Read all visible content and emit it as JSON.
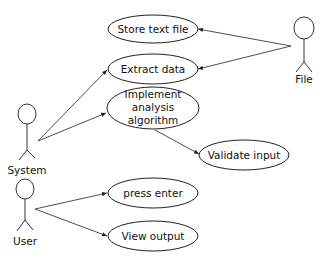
{
  "diagram": {
    "type": "UML use case diagram",
    "actors": [
      {
        "id": "system",
        "label": "System"
      },
      {
        "id": "file",
        "label": "File"
      },
      {
        "id": "user",
        "label": "User"
      }
    ],
    "use_cases": [
      {
        "id": "store_text_file",
        "label": "Store text file"
      },
      {
        "id": "extract_data",
        "label": "Extract data"
      },
      {
        "id": "implement",
        "lines": [
          "Implement",
          "analysis",
          "algorithm"
        ]
      },
      {
        "id": "validate_input",
        "label": "Validate input"
      },
      {
        "id": "press_enter",
        "label": "press enter"
      },
      {
        "id": "view_output",
        "label": "View output"
      }
    ],
    "associations": [
      {
        "from": "System",
        "to": "Extract data"
      },
      {
        "from": "System",
        "to": "Implement analysis algorithm"
      },
      {
        "from": "Implement analysis algorithm",
        "to": "Validate input"
      },
      {
        "from": "File",
        "to": "Store text file"
      },
      {
        "from": "File",
        "to": "Extract data"
      },
      {
        "from": "User",
        "to": "press enter"
      },
      {
        "from": "User",
        "to": "View output"
      }
    ]
  }
}
